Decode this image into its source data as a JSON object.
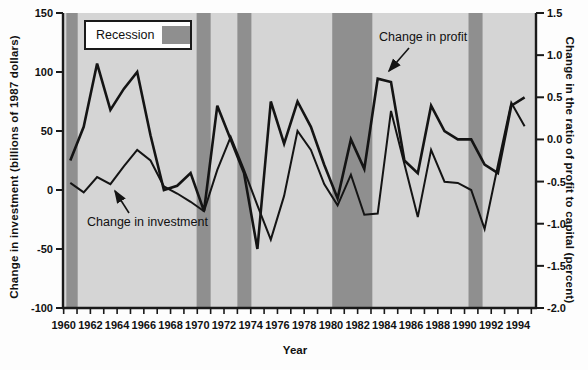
{
  "figure": {
    "x_axis_title": "Year",
    "left_axis_title": "Change in investment (billions of 1987 dollars)",
    "right_axis_title": "Change in the ratio of profit to capital (percent)",
    "legend_label": "Recession",
    "annotation_profit": "Change in profit",
    "annotation_investment": "Change in investment"
  },
  "chart_data": {
    "type": "line",
    "title": "",
    "xlabel": "Year",
    "x": [
      1960,
      1961,
      1962,
      1963,
      1964,
      1965,
      1966,
      1967,
      1968,
      1969,
      1970,
      1971,
      1972,
      1973,
      1974,
      1975,
      1976,
      1977,
      1978,
      1979,
      1980,
      1981,
      1982,
      1983,
      1984,
      1985,
      1986,
      1987,
      1988,
      1989,
      1990,
      1991,
      1992,
      1993,
      1994
    ],
    "series": [
      {
        "name": "Change in investment",
        "axis": "left",
        "units": "billions of 1987 dollars",
        "values": [
          6,
          -2,
          11,
          5,
          20,
          34,
          25,
          3,
          -3,
          -10,
          -18,
          17,
          45,
          17,
          -13,
          -42,
          -5,
          50,
          34,
          5,
          -13,
          13,
          -21,
          -20,
          67,
          22,
          -23,
          34,
          7,
          6,
          0,
          -33,
          21,
          74,
          54
        ]
      },
      {
        "name": "Change in profit",
        "axis": "right",
        "units": "percent",
        "values": [
          -0.25,
          0.15,
          0.9,
          0.35,
          0.6,
          0.8,
          0.05,
          -0.6,
          -0.55,
          -0.4,
          -0.85,
          0.4,
          0,
          -0.4,
          -1.3,
          0.45,
          -0.05,
          0.45,
          0.15,
          -0.3,
          -0.7,
          0,
          -0.35,
          0.72,
          0.68,
          -0.25,
          -0.4,
          0.4,
          0.1,
          0,
          0,
          -0.3,
          -0.4,
          0.4,
          0.5
        ]
      }
    ],
    "left_axis": {
      "label": "Change in investment (billions of 1987 dollars)",
      "range": [
        -100,
        150
      ],
      "tick_labels": [
        "150",
        "100",
        "50",
        "0",
        "-50",
        "-100"
      ],
      "tick_values": [
        150,
        100,
        50,
        0,
        -50,
        -100
      ]
    },
    "right_axis": {
      "label": "Change in the ratio of profit to capital (percent)",
      "range": [
        -2.0,
        1.5
      ],
      "tick_labels": [
        "1.5",
        "1.0",
        "0.5",
        "0.0",
        "-0.5",
        "-1.0",
        "-1.5",
        "-2.0"
      ],
      "tick_values": [
        1.5,
        1.0,
        0.5,
        0.0,
        -0.5,
        -1.0,
        -1.5,
        -2.0
      ]
    },
    "x_axis": {
      "label": "Year",
      "domain": [
        1959.95,
        1995.35
      ],
      "labeled_ticks": [
        1960,
        1962,
        1964,
        1966,
        1968,
        1970,
        1972,
        1974,
        1976,
        1978,
        1980,
        1982,
        1984,
        1986,
        1988,
        1990,
        1992,
        1994
      ],
      "minor_tick_start": 1960,
      "minor_tick_end": 1995
    },
    "recession_bands": [
      {
        "start": 1960.2,
        "end": 1961.05
      },
      {
        "start": 1969.95,
        "end": 1971.0
      },
      {
        "start": 1973.0,
        "end": 1974.05
      },
      {
        "start": 1980.1,
        "end": 1983.1
      },
      {
        "start": 1990.3,
        "end": 1991.35
      }
    ],
    "legend": {
      "label": "Recession",
      "position": "top-left-inside"
    },
    "grid": false,
    "colors": {
      "plot_background": "#d5d5d5",
      "recession_band": "#8f8f8f",
      "line": "#141414",
      "axis": "#1a1a1a",
      "text": "#111111",
      "figure_background": "#fdfdfd"
    }
  }
}
